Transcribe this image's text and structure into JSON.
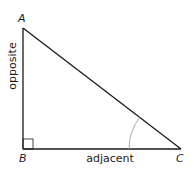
{
  "diagram": {
    "type": "right-triangle",
    "vertices": {
      "A": "A",
      "B": "B",
      "C": "C"
    },
    "sides": {
      "opposite": "opposite",
      "adjacent": "adjacent"
    },
    "right_angle_at": "B",
    "marked_angle_at": "C",
    "colors": {
      "line": "#1a1a1a",
      "arc": "#a0a0a0"
    }
  }
}
